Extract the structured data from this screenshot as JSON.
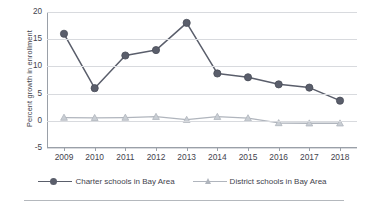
{
  "chart_data": {
    "type": "line",
    "title": "",
    "xlabel": "",
    "ylabel": "Percent growth in enrollment",
    "categories": [
      "2009",
      "2010",
      "2011",
      "2012",
      "2013",
      "2014",
      "2015",
      "2016",
      "2017",
      "2018"
    ],
    "ylim": [
      -5,
      20
    ],
    "yticks": [
      20,
      15,
      10,
      5,
      0,
      -5
    ],
    "ytick_labels": [
      "20",
      "15",
      "10",
      "5",
      "0",
      "-5"
    ],
    "grid": true,
    "legend_position": "bottom",
    "series": [
      {
        "name": "Charter schools in Bay Area",
        "marker": "circle",
        "color": "#5a5e6b",
        "values": [
          16.0,
          6.0,
          12.0,
          13.0,
          18.0,
          8.7,
          8.0,
          6.7,
          6.1,
          3.7
        ]
      },
      {
        "name": "District schools in Bay Area",
        "marker": "triangle",
        "color": "#b0b5bd",
        "values": [
          0.6,
          0.55,
          0.6,
          0.75,
          0.2,
          0.75,
          0.5,
          -0.4,
          -0.45,
          -0.45
        ]
      }
    ]
  },
  "axis": {
    "y_title": "Percent growth in enrollment"
  },
  "legend": {
    "entries": [
      {
        "label": "Charter schools in Bay Area"
      },
      {
        "label": "District schools in Bay Area"
      }
    ]
  },
  "colors": {
    "series_charter": "#5a5e6b",
    "series_district": "#b0b5bd",
    "gridline": "#d8dade",
    "axis": "#9aa0a8",
    "text": "#3f434d",
    "rule": "#b4b8bd",
    "background": "#ffffff"
  }
}
